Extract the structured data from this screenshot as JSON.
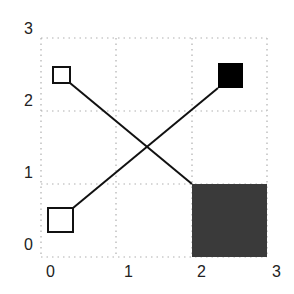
{
  "diagram": {
    "axes": {
      "x_ticks": [
        "0",
        "1",
        "2",
        "3"
      ],
      "y_ticks": [
        "0",
        "1",
        "2",
        "3"
      ],
      "grid": "dotted",
      "xlim": [
        0,
        3
      ],
      "ylim": [
        0,
        3
      ]
    },
    "shapes": [
      {
        "id": "open-square-top-left",
        "style": "outline",
        "fill": "#ffffff",
        "x": [
          0.15,
          0.39
        ],
        "y": [
          2.38,
          2.6
        ]
      },
      {
        "id": "filled-square-top-right",
        "style": "filled",
        "fill": "#000000",
        "x": [
          2.35,
          2.68
        ],
        "y": [
          2.3,
          2.65
        ]
      },
      {
        "id": "open-square-bottom-left",
        "style": "outline",
        "fill": "#ffffff",
        "x": [
          0.08,
          0.43
        ],
        "y": [
          0.34,
          0.67
        ]
      },
      {
        "id": "dark-square-bottom-right",
        "style": "filled",
        "fill": "#3a3a3a",
        "x": [
          2.0,
          3.0
        ],
        "y": [
          0.0,
          1.0
        ]
      }
    ],
    "connectors": [
      {
        "from": "open-square-top-left",
        "to": "dark-square-bottom-right"
      },
      {
        "from": "open-square-bottom-left",
        "to": "filled-square-top-right"
      }
    ],
    "colors": {
      "grid": "#b0b0b0",
      "line": "#111111",
      "dark_fill": "#3a3a3a",
      "black_fill": "#000000"
    }
  }
}
